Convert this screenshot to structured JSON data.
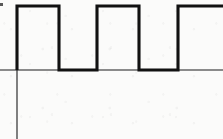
{
  "figure": {
    "caption": "",
    "background_color": "#fbfbfa",
    "ink_color": "#111111",
    "axis_color": "#1b1b1b"
  },
  "axes": {
    "vertical_axis": {
      "name": "y-axis",
      "x": 17,
      "y_top": 5,
      "y_bottom": 139,
      "stroke_width": 1.1
    },
    "horizontal_axis": {
      "name": "x-axis-baseline",
      "y": 70,
      "x_left": 0,
      "x_right": 223,
      "stroke_width": 1.1
    },
    "tick_labels": [],
    "axis_labels": {
      "x": "",
      "y": ""
    }
  },
  "chart_data": {
    "type": "line",
    "subtitle": "",
    "xlabel": "",
    "ylabel": "",
    "xlim": [
      0,
      223
    ],
    "ylim": [
      139,
      0
    ],
    "grid": false,
    "legend": null,
    "annotations": [],
    "levels": {
      "high_y": 6,
      "low_y": 70
    },
    "series": [
      {
        "name": "square-wave",
        "color": "#111111",
        "stroke_width": 3.1,
        "points": [
          [
            17,
            70
          ],
          [
            17,
            6
          ],
          [
            59,
            6
          ],
          [
            59,
            70
          ],
          [
            97,
            70
          ],
          [
            97,
            6
          ],
          [
            139,
            6
          ],
          [
            139,
            70
          ],
          [
            178,
            70
          ],
          [
            178,
            6
          ],
          [
            223,
            6
          ]
        ],
        "path": "M 17 70 L 17 6 L 59 6 L 59 70 L 97 70 L 97 6 L 139 6 L 139 70 L 178 70 L 178 6 L 223 6",
        "pulses": [
          {
            "index": 1,
            "rise_x": 17,
            "fall_x": 59,
            "width": 42,
            "clipped": false
          },
          {
            "index": 2,
            "rise_x": 97,
            "fall_x": 139,
            "width": 42,
            "clipped": false
          },
          {
            "index": 3,
            "rise_x": 178,
            "fall_x": null,
            "width": 45,
            "clipped": true
          }
        ],
        "gaps": [
          {
            "start_x": 59,
            "end_x": 97,
            "width": 38
          },
          {
            "start_x": 139,
            "end_x": 178,
            "width": 39
          }
        ],
        "period": 80,
        "duty_cycle": "52%",
        "cycles_visible": 3
      }
    ]
  },
  "artifacts": [
    {
      "name": "left-edge-scan-mark",
      "x": 0,
      "y": 3,
      "width": 3,
      "height": 3,
      "color": "#2a2a2a"
    }
  ]
}
